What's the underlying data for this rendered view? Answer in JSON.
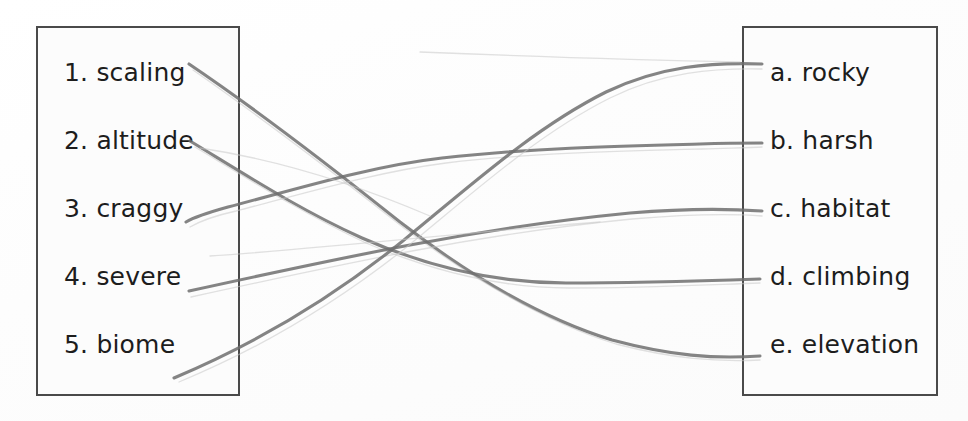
{
  "worksheet": {
    "type": "matching-exercise",
    "topic": "mountain-vocabulary"
  },
  "left_column": {
    "name": "terms",
    "items": [
      {
        "marker": "1.",
        "label": "1. scaling",
        "word": "scaling"
      },
      {
        "marker": "2.",
        "label": "2. altitude",
        "word": "altitude"
      },
      {
        "marker": "3.",
        "label": "3. craggy",
        "word": "craggy"
      },
      {
        "marker": "4.",
        "label": "4. severe",
        "word": "severe"
      },
      {
        "marker": "5.",
        "label": "5. biome",
        "word": "biome"
      }
    ]
  },
  "right_column": {
    "name": "definitions",
    "items": [
      {
        "marker": "a.",
        "label": "a. rocky",
        "word": "rocky"
      },
      {
        "marker": "b.",
        "label": "b. harsh",
        "word": "harsh"
      },
      {
        "marker": "c.",
        "label": "c. habitat",
        "word": "habitat"
      },
      {
        "marker": "d.",
        "label": "d. climbing",
        "word": "climbing"
      },
      {
        "marker": "e.",
        "label": "e. elevation",
        "word": "elevation"
      }
    ]
  },
  "connections": [
    {
      "from": "1. scaling",
      "to": "e. elevation",
      "from_index": 0,
      "to_index": 4
    },
    {
      "from": "2. altitude",
      "to": "d. climbing",
      "from_index": 1,
      "to_index": 3
    },
    {
      "from": "3. craggy",
      "to": "b. harsh",
      "from_index": 2,
      "to_index": 1
    },
    {
      "from": "4. severe",
      "to": "c. habitat",
      "from_index": 3,
      "to_index": 2
    },
    {
      "from": "5. biome",
      "to": "a. rocky",
      "from_index": 4,
      "to_index": 0
    }
  ],
  "colors": {
    "background": "#ffffff",
    "box_border": "#4a4a4a",
    "text": "#1d1d1d",
    "pencil_line": "#6f6f6f",
    "faint_line": "#c8c8c8"
  }
}
